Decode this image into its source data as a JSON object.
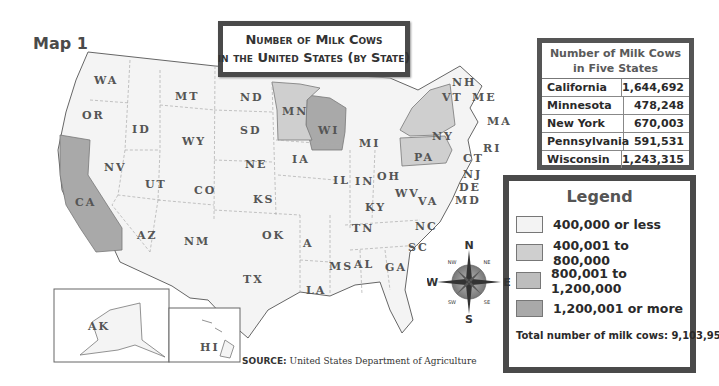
{
  "map_label": "Map 1",
  "title": {
    "line1": "Number of Milk Cows",
    "line2": "in the United States (by State)"
  },
  "table": {
    "header_line1": "Number of Milk Cows",
    "header_line2": "in Five States",
    "rows": [
      {
        "state": "California",
        "value": "1,644,692"
      },
      {
        "state": "Minnesota",
        "value": "478,248"
      },
      {
        "state": "New York",
        "value": "670,003"
      },
      {
        "state": "Pennsylvania",
        "value": "591,531"
      },
      {
        "state": "Wisconsin",
        "value": "1,243,315"
      }
    ]
  },
  "legend": {
    "title": "Legend",
    "items": [
      {
        "label": "400,000 or less",
        "color": "#f3f3f3"
      },
      {
        "label": "400,001 to 800,000",
        "color": "#cfcfcf"
      },
      {
        "label": "800,001 to 1,200,000",
        "color": "#bdbdbd"
      },
      {
        "label": "1,200,001 or more",
        "color": "#a9a9a9"
      }
    ],
    "total": "Total number of milk cows: 9,103,959"
  },
  "source": {
    "label": "SOURCE:",
    "text": "United States Department of Agriculture"
  },
  "compass": {
    "n": "N",
    "s": "S",
    "e": "E",
    "w": "W",
    "ne": "NE",
    "nw": "NW",
    "se": "SE",
    "sw": "SW"
  },
  "states": {
    "WA": "WA",
    "OR": "OR",
    "CA": "CA",
    "ID": "ID",
    "NV": "NV",
    "MT": "MT",
    "WY": "WY",
    "UT": "UT",
    "AZ": "AZ",
    "CO": "CO",
    "NM": "NM",
    "ND": "ND",
    "SD": "SD",
    "NE": "NE",
    "KS": "KS",
    "OK": "OK",
    "TX": "TX",
    "MN": "MN",
    "IA": "IA",
    "A": "A",
    "LA": "LA",
    "WI": "WI",
    "IL": "IL",
    "MI": "MI",
    "IN": "IN",
    "OH": "OH",
    "KY": "KY",
    "TN": "TN",
    "MS": "MS",
    "AL": "AL",
    "GA": "GA",
    "WV": "WV",
    "VA": "VA",
    "NC": "NC",
    "SC": "SC",
    "NY": "NY",
    "PA": "PA",
    "VT": "VT",
    "NH": "NH",
    "ME": "ME",
    "MA": "MA",
    "RI": "RI",
    "CT": "CT",
    "NJ": "NJ",
    "DE": "DE",
    "MD": "MD",
    "AK": "AK",
    "HI": "HI"
  }
}
